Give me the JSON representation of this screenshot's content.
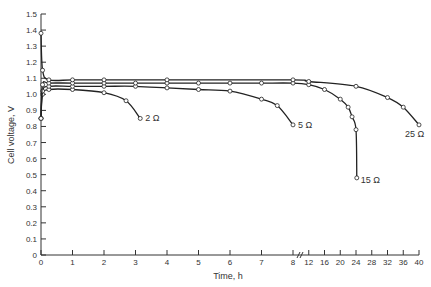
{
  "chart_data": {
    "type": "line",
    "title": "",
    "xlabel": "Time, h",
    "ylabel": "Cell voltage, V",
    "ylim": [
      0,
      1.5
    ],
    "xlim": [
      0,
      40
    ],
    "x_axis_break": {
      "at": 8,
      "note": "Scale changes after 8 h: 0–8 h linear by 1 h, then 12–40 h by 4 h"
    },
    "grid": false,
    "legend": "inline labels at curve ends",
    "y_ticks": [
      "0",
      "0.1",
      "0.2",
      "0.3",
      "0.4",
      "0.5",
      "0.6",
      "0.7",
      "0.8",
      "0.9",
      "1.0",
      "1.1",
      "1.2",
      "1.3",
      "1.4",
      "1.5"
    ],
    "x_ticks": [
      "0",
      "1",
      "2",
      "3",
      "4",
      "5",
      "6",
      "7",
      "8",
      "12",
      "16",
      "20",
      "24",
      "28",
      "32",
      "36",
      "40"
    ],
    "series": [
      {
        "name": "2 Ω",
        "label": "2 Ω",
        "x": [
          0,
          0.05,
          0.25,
          1,
          2,
          2.7,
          3.15
        ],
        "y": [
          0.85,
          1.0,
          1.03,
          1.03,
          1.01,
          0.96,
          0.85
        ]
      },
      {
        "name": "5 Ω",
        "label": "5 Ω",
        "x": [
          0,
          0.05,
          0.25,
          1,
          2,
          3,
          4,
          5,
          6,
          7,
          7.5,
          8
        ],
        "y": [
          0.85,
          1.02,
          1.05,
          1.05,
          1.05,
          1.05,
          1.04,
          1.03,
          1.02,
          0.97,
          0.93,
          0.81
        ]
      },
      {
        "name": "15 Ω",
        "label": "15 Ω",
        "x": [
          0,
          0.05,
          0.25,
          1,
          2,
          3,
          4,
          5,
          6,
          7,
          8,
          12,
          16,
          20,
          22,
          23,
          24,
          24.2
        ],
        "y": [
          0.85,
          1.06,
          1.07,
          1.07,
          1.07,
          1.07,
          1.07,
          1.07,
          1.07,
          1.07,
          1.07,
          1.06,
          1.03,
          0.97,
          0.92,
          0.86,
          0.78,
          0.48
        ]
      },
      {
        "name": "25 Ω",
        "label": "25 Ω",
        "x": [
          0,
          0.05,
          0.25,
          1,
          2,
          4,
          8,
          12,
          24,
          32,
          36,
          40
        ],
        "y": [
          1.38,
          1.15,
          1.09,
          1.09,
          1.09,
          1.09,
          1.09,
          1.08,
          1.05,
          0.98,
          0.92,
          0.81
        ]
      }
    ]
  }
}
